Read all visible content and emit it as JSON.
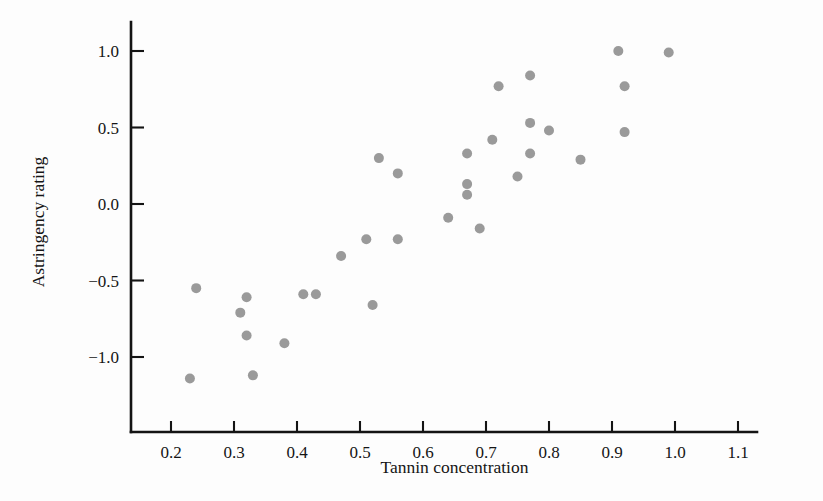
{
  "chart_data": {
    "type": "scatter",
    "title": "",
    "xlabel": "Tannin concentration",
    "ylabel": "Astringency rating",
    "xlim": [
      0.155,
      1.155
    ],
    "ylim": [
      -1.28,
      1.12
    ],
    "grid": false,
    "legend": null,
    "marker": {
      "shape": "circle",
      "color": "#9a9a9a",
      "size_px": 10
    },
    "xticks": [
      "0.2",
      "0.3",
      "0.4",
      "0.5",
      "0.6",
      "0.7",
      "0.8",
      "0.9",
      "1.0",
      "1.1"
    ],
    "xtick_values": [
      0.2,
      0.3,
      0.4,
      0.5,
      0.6,
      0.7,
      0.8,
      0.9,
      1.0,
      1.1
    ],
    "yticks": [
      "1.0",
      "0.5",
      "0.0",
      "−0.5",
      "−1.0"
    ],
    "ytick_values": [
      1.0,
      0.5,
      0.0,
      -0.5,
      -1.0
    ],
    "points": [
      {
        "x": 0.23,
        "y": -1.14
      },
      {
        "x": 0.24,
        "y": -0.55
      },
      {
        "x": 0.31,
        "y": -0.71
      },
      {
        "x": 0.32,
        "y": -0.61
      },
      {
        "x": 0.32,
        "y": -0.86
      },
      {
        "x": 0.33,
        "y": -1.12
      },
      {
        "x": 0.38,
        "y": -0.91
      },
      {
        "x": 0.41,
        "y": -0.59
      },
      {
        "x": 0.43,
        "y": -0.59
      },
      {
        "x": 0.47,
        "y": -0.34
      },
      {
        "x": 0.51,
        "y": -0.23
      },
      {
        "x": 0.52,
        "y": -0.66
      },
      {
        "x": 0.53,
        "y": 0.3
      },
      {
        "x": 0.56,
        "y": 0.2
      },
      {
        "x": 0.56,
        "y": -0.23
      },
      {
        "x": 0.64,
        "y": -0.09
      },
      {
        "x": 0.67,
        "y": 0.33
      },
      {
        "x": 0.67,
        "y": 0.13
      },
      {
        "x": 0.67,
        "y": 0.06
      },
      {
        "x": 0.69,
        "y": -0.16
      },
      {
        "x": 0.71,
        "y": 0.42
      },
      {
        "x": 0.72,
        "y": 0.77
      },
      {
        "x": 0.75,
        "y": 0.18
      },
      {
        "x": 0.77,
        "y": 0.84
      },
      {
        "x": 0.77,
        "y": 0.53
      },
      {
        "x": 0.77,
        "y": 0.33
      },
      {
        "x": 0.8,
        "y": 0.48
      },
      {
        "x": 0.85,
        "y": 0.29
      },
      {
        "x": 0.91,
        "y": 1.0
      },
      {
        "x": 0.92,
        "y": 0.77
      },
      {
        "x": 0.92,
        "y": 0.47
      },
      {
        "x": 0.99,
        "y": 0.99
      }
    ]
  }
}
